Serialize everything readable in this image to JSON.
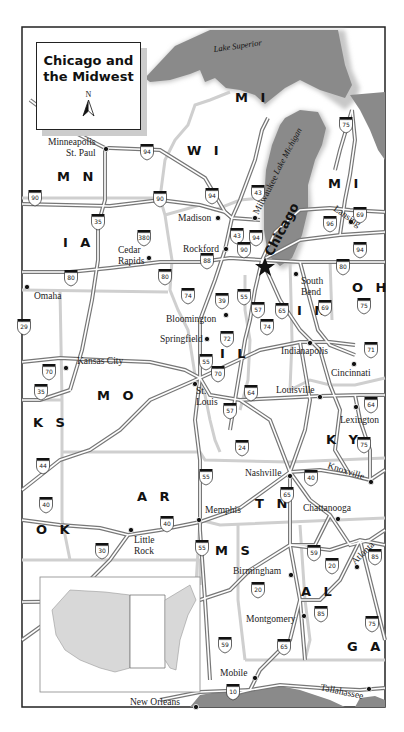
{
  "title": {
    "line1": "Chicago and",
    "line2": "the Midwest",
    "north_label": "N"
  },
  "lakes": [
    {
      "name": "Lake Superior"
    },
    {
      "name": "Lake Michigan"
    }
  ],
  "states": [
    {
      "id": "mn",
      "label": "M N"
    },
    {
      "id": "wi",
      "label": "W I"
    },
    {
      "id": "mi_upper",
      "label": "M I"
    },
    {
      "id": "mi_lower",
      "label": "M I"
    },
    {
      "id": "ia",
      "label": "I A"
    },
    {
      "id": "il",
      "label": "I L"
    },
    {
      "id": "in",
      "label": "I N"
    },
    {
      "id": "oh",
      "label": "O H"
    },
    {
      "id": "mo",
      "label": "M O"
    },
    {
      "id": "ks",
      "label": "K S"
    },
    {
      "id": "ky",
      "label": "K Y"
    },
    {
      "id": "ok",
      "label": "O K"
    },
    {
      "id": "ar",
      "label": "A R"
    },
    {
      "id": "tn",
      "label": "T N"
    },
    {
      "id": "ms",
      "label": "M S"
    },
    {
      "id": "al",
      "label": "A L"
    },
    {
      "id": "ga",
      "label": "G A"
    }
  ],
  "featured_city": {
    "name": "Chicago"
  },
  "cities": [
    {
      "id": "minneapolis",
      "line1": "Minneapolis",
      "line2": "St. Paul"
    },
    {
      "id": "madison",
      "line1": "Madison"
    },
    {
      "id": "milwaukee",
      "line1": "Milwaukee"
    },
    {
      "id": "rockford",
      "line1": "Rockford"
    },
    {
      "id": "cedar_rapids",
      "line1": "Cedar",
      "line2": "Rapids"
    },
    {
      "id": "omaha",
      "line1": "Omaha"
    },
    {
      "id": "lansing",
      "line1": "Lansing"
    },
    {
      "id": "south_bend",
      "line1": "South",
      "line2": "Bend"
    },
    {
      "id": "bloomington",
      "line1": "Bloomington"
    },
    {
      "id": "springfield",
      "line1": "Springfield"
    },
    {
      "id": "indianapolis",
      "line1": "Indianapolis"
    },
    {
      "id": "kansas_city",
      "line1": "Kansas City"
    },
    {
      "id": "st_louis",
      "line1": "St.",
      "line2": "Louis"
    },
    {
      "id": "cincinnati",
      "line1": "Cincinnati"
    },
    {
      "id": "louisville",
      "line1": "Louisville"
    },
    {
      "id": "lexington",
      "line1": "Lexington"
    },
    {
      "id": "nashville",
      "line1": "Nashville"
    },
    {
      "id": "knoxville",
      "line1": "Knoxville"
    },
    {
      "id": "memphis",
      "line1": "Memphis"
    },
    {
      "id": "chattanooga",
      "line1": "Chattanooga"
    },
    {
      "id": "little_rock",
      "line1": "Little",
      "line2": "Rock"
    },
    {
      "id": "atlanta",
      "line1": "Atlanta"
    },
    {
      "id": "birmingham",
      "line1": "Birmingham"
    },
    {
      "id": "montgomery",
      "line1": "Montgomery"
    },
    {
      "id": "mobile",
      "line1": "Mobile"
    },
    {
      "id": "tallahassee",
      "line1": "Tallahassee"
    },
    {
      "id": "new_orleans",
      "line1": "New Orleans"
    }
  ],
  "interstate_shields": [
    "94",
    "75",
    "90",
    "94",
    "90",
    "43",
    "35",
    "380",
    "43",
    "94",
    "88",
    "90",
    "96",
    "69",
    "94",
    "80",
    "80",
    "74",
    "39",
    "55",
    "57",
    "65",
    "80",
    "69",
    "75",
    "72",
    "74",
    "29",
    "70",
    "55",
    "70",
    "71",
    "35",
    "64",
    "64",
    "57",
    "24",
    "75",
    "44",
    "55",
    "40",
    "40",
    "65",
    "40",
    "30",
    "59",
    "20",
    "85",
    "55",
    "20",
    "85",
    "75",
    "59",
    "65",
    "10"
  ],
  "colors": {
    "water": "#8a8a8a",
    "water_shadow": "#c8c8c8",
    "land": "#ffffff",
    "state_border": "#cfcfcf",
    "road": "#777777",
    "text": "#111111"
  }
}
